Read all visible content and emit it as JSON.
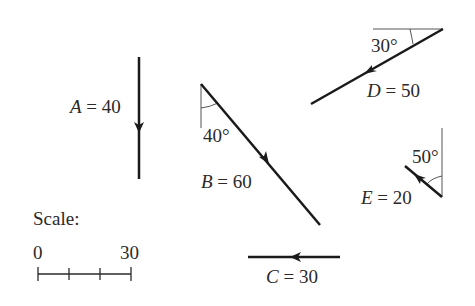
{
  "diagram": {
    "type": "vector-diagram",
    "vectors": [
      {
        "name": "A",
        "label": "A = 40",
        "magnitude": 40,
        "direction": "straight down",
        "angle_label": ""
      },
      {
        "name": "B",
        "label": "B = 60",
        "magnitude": 60,
        "direction": "down-right",
        "angle_label": "40°",
        "angle_reference": "vertical"
      },
      {
        "name": "C",
        "label": "C = 30",
        "magnitude": 30,
        "direction": "left",
        "angle_label": ""
      },
      {
        "name": "D",
        "label": "D = 50",
        "magnitude": 50,
        "direction": "down-left",
        "angle_label": "30°",
        "angle_reference": "horizontal"
      },
      {
        "name": "E",
        "label": "E = 20",
        "magnitude": 20,
        "direction": "up-left",
        "angle_label": "50°",
        "angle_reference": "vertical"
      }
    ],
    "labels": {
      "A": {
        "var": "A",
        "eq": " = 40"
      },
      "B": {
        "var": "B",
        "eq": " = 60",
        "angle": "40°"
      },
      "C": {
        "var": "C",
        "eq": " = 30"
      },
      "D": {
        "var": "D",
        "eq": " = 50",
        "angle": "30°"
      },
      "E": {
        "var": "E",
        "eq": " = 20",
        "angle": "50°"
      }
    },
    "scale": {
      "title": "Scale:",
      "start_label": "0",
      "end_label": "30",
      "divisions": 3
    },
    "colors": {
      "stroke": "#1a1a1a",
      "text": "#2a2a2a",
      "reference": "#555555"
    }
  }
}
